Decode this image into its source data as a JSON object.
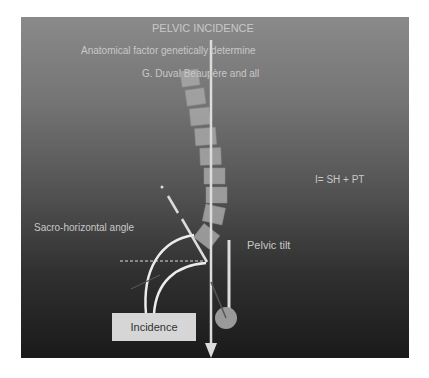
{
  "title": "PELVIC INCIDENCE",
  "subtitle": "Anatomical factor genetically determine",
  "credit": "G. Duval Beaupère and all",
  "formula": "I= SH + PT",
  "labels": {
    "sacro_horizontal": "Sacro-horizontal angle",
    "pelvic_tilt": "Pelvic tilt",
    "incidence": "Incidence"
  },
  "colors": {
    "panel_top": "#8a8a8a",
    "panel_bottom": "#1a1a1a",
    "vertebra": "#a8a8a8",
    "line": "#e6e6e6",
    "femoral_head": "#9a9a9a",
    "incidence_box": "#d6d6d6"
  }
}
